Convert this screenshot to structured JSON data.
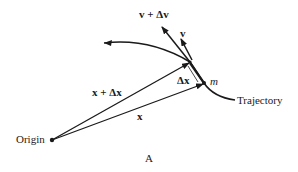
{
  "figure": {
    "panel_label": "A",
    "labels": {
      "origin": "Origin",
      "position": "x",
      "position_displaced": "x + Δx",
      "displacement": "Δx",
      "velocity": "v",
      "velocity_changed": "v + Δv",
      "mass": "m",
      "trajectory": "Trajectory"
    }
  },
  "colors": {
    "ink": "#1a1a1a",
    "background": "#ffffff"
  }
}
